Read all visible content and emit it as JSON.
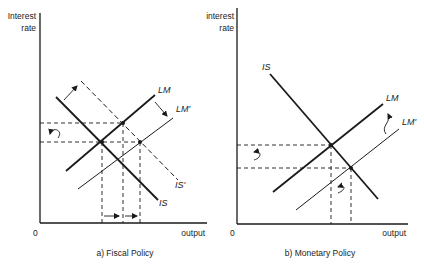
{
  "panels": [
    {
      "id": "fiscal",
      "caption": "a) Fiscal Policy",
      "y_axis_label_line1": "Interest",
      "y_axis_label_line2": "rate",
      "x_axis_label": "output",
      "origin_label": "0",
      "curves": {
        "lm": "LM",
        "lm_prime": "LM'",
        "is": "IS",
        "is_prime": "IS'"
      }
    },
    {
      "id": "monetary",
      "caption": "b) Monetary Policy",
      "y_axis_label_line1": "interest",
      "y_axis_label_line2": "rate",
      "x_axis_label": "output",
      "origin_label": "0",
      "curves": {
        "is": "IS",
        "lm": "LM",
        "lm_prime": "LM'"
      }
    }
  ],
  "colors": {
    "line": "#1a1a1a",
    "background": "#ffffff"
  }
}
